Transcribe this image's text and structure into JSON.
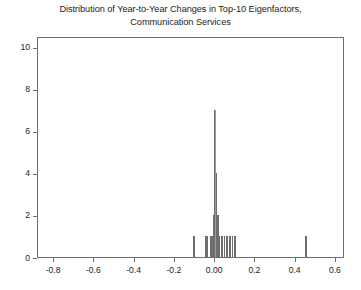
{
  "chart_data": {
    "type": "bar",
    "title": "Distribution of Year-to-Year Changes in Top-10 Eigenfactors, Communication Services",
    "title_lines": [
      "Distribution of Year-to-Year Changes in Top-10 Eigenfactors,",
      "Communication Services"
    ],
    "xlabel": "",
    "ylabel": "",
    "xlim": [
      -0.88,
      0.645
    ],
    "ylim": [
      0,
      10.5
    ],
    "grid": false,
    "legend": null,
    "bar_color": "#6e6e6e",
    "xticks": [
      -0.8,
      -0.6,
      -0.4,
      -0.2,
      0.0,
      0.2,
      0.4,
      0.6
    ],
    "xticklabels": [
      "-0.8",
      "-0.6",
      "-0.4",
      "-0.2",
      "0.00",
      "0.2",
      "0.4",
      "0.6"
    ],
    "yticks": [
      0,
      2,
      4,
      6,
      8,
      10
    ],
    "yticklabels": [
      "0",
      "2",
      "4",
      "6",
      "8",
      "10"
    ],
    "bin_width": 0.006,
    "x": [
      -0.105,
      -0.046,
      -0.04,
      -0.022,
      -0.012,
      -0.006,
      0.0,
      0.006,
      0.013,
      0.02,
      0.033,
      0.046,
      0.06,
      0.073,
      0.086,
      0.098,
      0.452
    ],
    "values": [
      1,
      1,
      1,
      1,
      1,
      2,
      7,
      4,
      2,
      1,
      1,
      1,
      1,
      1,
      1,
      1,
      1
    ]
  }
}
